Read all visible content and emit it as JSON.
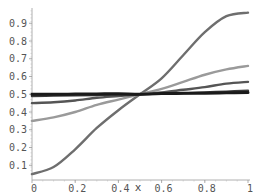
{
  "chart_data": {
    "type": "line",
    "title": "",
    "xlabel": "x",
    "ylabel": "",
    "xlim": [
      0,
      1
    ],
    "ylim": [
      0.0,
      1.0
    ],
    "grid": false,
    "legend": null,
    "x_ticks": [
      "0",
      "0.2",
      "0.4",
      "0.6",
      "0.8",
      "1"
    ],
    "y_ticks": [
      "0.1",
      "0.2",
      "0.3",
      "0.4",
      "0.5",
      "0.6",
      "0.7",
      "0.8",
      "0.9"
    ],
    "x": [
      0,
      0.1,
      0.2,
      0.3,
      0.4,
      0.5,
      0.6,
      0.7,
      0.8,
      0.9,
      1.0
    ],
    "series": [
      {
        "name": "curve-1",
        "color": "#6e6e6e",
        "values": [
          0.05,
          0.09,
          0.19,
          0.31,
          0.41,
          0.5,
          0.59,
          0.72,
          0.85,
          0.94,
          0.96
        ]
      },
      {
        "name": "curve-2",
        "color": "#9a9a9a",
        "values": [
          0.35,
          0.37,
          0.4,
          0.44,
          0.47,
          0.5,
          0.53,
          0.57,
          0.61,
          0.64,
          0.66
        ]
      },
      {
        "name": "curve-3",
        "color": "#555555",
        "values": [
          0.45,
          0.455,
          0.465,
          0.48,
          0.49,
          0.5,
          0.51,
          0.525,
          0.54,
          0.56,
          0.57
        ]
      },
      {
        "name": "curve-4",
        "color": "#3a3a3a",
        "values": [
          0.49,
          0.492,
          0.494,
          0.496,
          0.498,
          0.5,
          0.502,
          0.505,
          0.51,
          0.515,
          0.52
        ]
      },
      {
        "name": "curve-5",
        "color": "#1a1a1a",
        "values": [
          0.5,
          0.5,
          0.501,
          0.502,
          0.503,
          0.5,
          0.504,
          0.505,
          0.506,
          0.508,
          0.51
        ]
      }
    ]
  }
}
